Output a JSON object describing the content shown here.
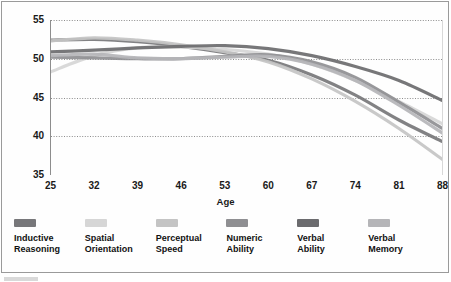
{
  "chart_data": {
    "type": "line",
    "title": "",
    "xlabel": "Age",
    "ylabel": "Mean T-Scores",
    "xlim": [
      25,
      88
    ],
    "ylim": [
      35,
      55
    ],
    "grid": true,
    "legend_position": "bottom",
    "x": [
      25,
      32,
      39,
      46,
      53,
      60,
      67,
      74,
      81,
      88
    ],
    "xticks": [
      "25",
      "32",
      "39",
      "46",
      "53",
      "60",
      "67",
      "74",
      "81",
      "88"
    ],
    "yticks": [
      "55",
      "50",
      "45",
      "40",
      "35"
    ],
    "series": [
      {
        "name": "Inductive Reasoning",
        "color": "#77777a",
        "values": [
          52.4,
          52.5,
          52.2,
          51.6,
          50.8,
          49.8,
          47.9,
          45.3,
          42.1,
          39.3
        ]
      },
      {
        "name": "Spatial Orientation",
        "color": "#d6d6d6",
        "values": [
          48.3,
          50.4,
          51.4,
          51.5,
          51.2,
          50.6,
          49.3,
          47.2,
          44.5,
          41.6
        ]
      },
      {
        "name": "Perceptual Speed",
        "color": "#c4c4c4",
        "values": [
          52.3,
          52.7,
          52.4,
          51.8,
          50.9,
          49.6,
          47.4,
          44.5,
          41.0,
          37.0
        ]
      },
      {
        "name": "Numeric Ability",
        "color": "#8f8f92",
        "values": [
          50.2,
          50.1,
          50.0,
          50.0,
          50.3,
          50.5,
          49.6,
          47.6,
          44.4,
          41.0
        ]
      },
      {
        "name": "Verbal Ability",
        "color": "#6b6b6e",
        "values": [
          50.9,
          51.1,
          51.4,
          51.6,
          51.7,
          51.3,
          50.4,
          49.0,
          47.2,
          44.6
        ]
      },
      {
        "name": "Verbal Memory",
        "color": "#b5b5b8",
        "values": [
          50.4,
          50.6,
          50.1,
          50.0,
          50.2,
          50.3,
          49.3,
          47.2,
          44.0,
          40.4
        ]
      }
    ]
  },
  "axis": {
    "y_title": "Mean T-Scores",
    "x_title": "Age",
    "y_ticks": [
      "55",
      "50",
      "45",
      "40",
      "35"
    ],
    "x_ticks": [
      "25",
      "32",
      "39",
      "46",
      "53",
      "60",
      "67",
      "74",
      "81",
      "88"
    ]
  },
  "legend": {
    "items": [
      {
        "label": "Inductive\nReasoning",
        "color": "#77777a"
      },
      {
        "label": "Spatial\nOrientation",
        "color": "#d6d6d6"
      },
      {
        "label": "Perceptual\nSpeed",
        "color": "#c4c4c4"
      },
      {
        "label": "Numeric\nAbility",
        "color": "#8f8f92"
      },
      {
        "label": "Verbal\nAbility",
        "color": "#6b6b6e"
      },
      {
        "label": "Verbal\nMemory",
        "color": "#b5b5b8"
      }
    ]
  }
}
